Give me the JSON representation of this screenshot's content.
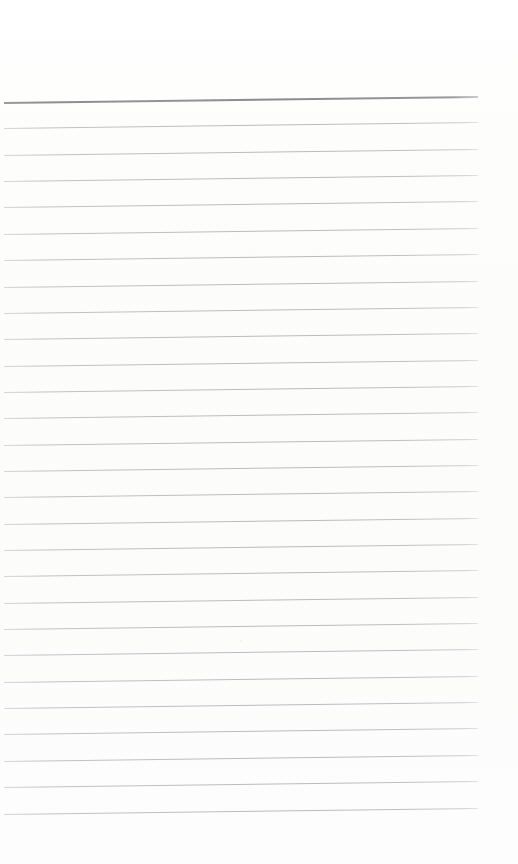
{
  "document": {
    "type": "scanned-image",
    "subject": "blank lined notepad page",
    "page_width": 518,
    "page_height": 864,
    "background_color": "#fdfdfd",
    "has_text_content": false,
    "visible_text": "",
    "notes": "No handwriting, no printed text, no headings, no page numbers are present."
  },
  "paper": {
    "top_margin_px": 102,
    "bottom_margin_px": 45,
    "left_margin_px": 4,
    "right_margin_px": 40,
    "skew_degrees": -0.72
  },
  "ruling": {
    "header_rule": {
      "label": "header-rule",
      "y_left": 102,
      "color": "#8d8e90",
      "thickness_px": 2,
      "x_start": 4,
      "x_end": 478
    },
    "body_rule_color": "#b1b2b4",
    "body_rule_thickness_px": 1,
    "line_spacing_px": 26.35,
    "body_rule_count": 27,
    "x_start": 4,
    "x_end": 478,
    "body_rule_y_left": [
      128.4,
      154.7,
      181.1,
      207.4,
      233.8,
      260.1,
      286.5,
      312.8,
      339.2,
      365.5,
      391.9,
      418.2,
      444.6,
      470.9,
      497.3,
      523.6,
      550.0,
      576.3,
      602.7,
      629.0,
      655.4,
      681.7,
      708.1,
      734.4,
      760.8,
      787.1,
      813.5
    ]
  },
  "artifacts": {
    "specks": [
      {
        "x": 240,
        "y": 640,
        "size": 2,
        "opacity": 0.35
      },
      {
        "x": 98,
        "y": 305,
        "size": 1,
        "opacity": 0.22
      },
      {
        "x": 402,
        "y": 206,
        "size": 1,
        "opacity": 0.2
      },
      {
        "x": 156,
        "y": 742,
        "size": 1,
        "opacity": 0.18
      },
      {
        "x": 330,
        "y": 470,
        "size": 1,
        "opacity": 0.18
      }
    ]
  }
}
